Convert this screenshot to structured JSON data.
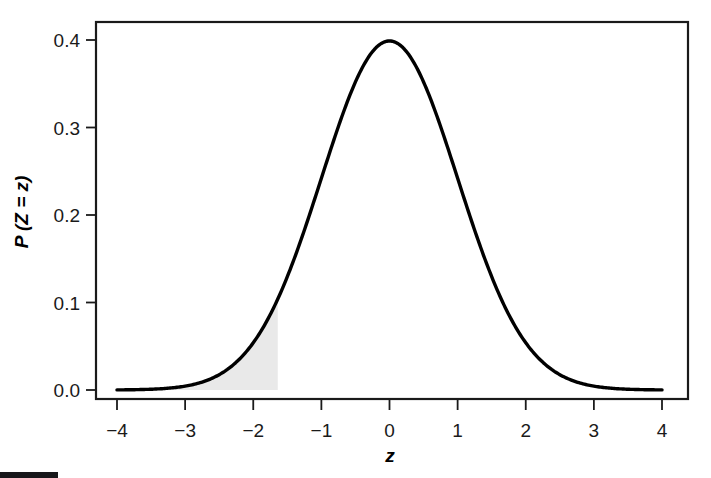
{
  "figure": {
    "background_color": "#ffffff",
    "frame_color": "#1a1a1a",
    "curve_color": "#000000",
    "shade_color": "#e9e9e9"
  },
  "chart_data": {
    "type": "line",
    "title": "",
    "subtitle": "",
    "xlabel": "z",
    "ylabel": "P (Z = z)",
    "xlim": [
      -4,
      4
    ],
    "ylim": [
      0,
      0.42
    ],
    "grid": false,
    "legend": null,
    "x_ticks": [
      -4,
      -3,
      -2,
      -1,
      0,
      1,
      2,
      3,
      4
    ],
    "x_tick_labels": [
      "−4",
      "−3",
      "−2",
      "−1",
      "0",
      "1",
      "2",
      "3",
      "4"
    ],
    "y_ticks": [
      0.0,
      0.1,
      0.2,
      0.3,
      0.4
    ],
    "y_tick_labels": [
      "0.0",
      "0.1",
      "0.2",
      "0.3",
      "0.4"
    ],
    "series": [
      {
        "name": "standard normal density",
        "distribution": "normal",
        "mean": 0,
        "sd": 1,
        "peak_value": 0.3989,
        "x": [
          -4.0,
          -3.8,
          -3.6,
          -3.4,
          -3.2,
          -3.0,
          -2.8,
          -2.6,
          -2.4,
          -2.2,
          -2.0,
          -1.8,
          -1.6,
          -1.4,
          -1.2,
          -1.0,
          -0.8,
          -0.6,
          -0.4,
          -0.2,
          0.0,
          0.2,
          0.4,
          0.6,
          0.8,
          1.0,
          1.2,
          1.4,
          1.6,
          1.8,
          2.0,
          2.2,
          2.4,
          2.6,
          2.8,
          3.0,
          3.2,
          3.4,
          3.6,
          3.8,
          4.0
        ],
        "values": [
          0.0001,
          0.0003,
          0.0006,
          0.0012,
          0.0024,
          0.0044,
          0.0079,
          0.0136,
          0.0224,
          0.0355,
          0.054,
          0.079,
          0.1109,
          0.1497,
          0.1942,
          0.242,
          0.2897,
          0.3332,
          0.3683,
          0.391,
          0.3989,
          0.391,
          0.3683,
          0.3332,
          0.2897,
          0.242,
          0.1942,
          0.1497,
          0.1109,
          0.079,
          0.054,
          0.0355,
          0.0224,
          0.0136,
          0.0079,
          0.0044,
          0.0024,
          0.0012,
          0.0006,
          0.0003,
          0.0001
        ]
      }
    ],
    "annotations": [
      {
        "kind": "shaded-area",
        "label": "left tail shaded region",
        "x_from": -4,
        "x_to": -1.64,
        "area": 0.05,
        "color": "#e9e9e9"
      }
    ]
  }
}
